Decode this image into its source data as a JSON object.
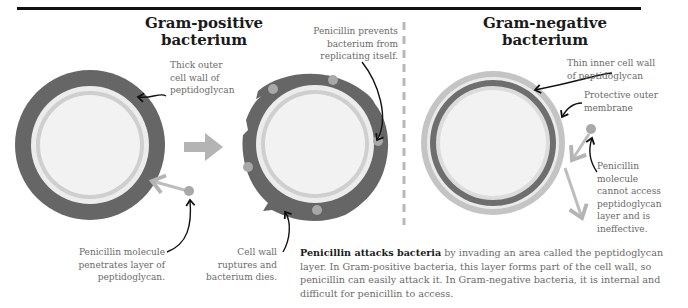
{
  "gram_positive": {
    "title_line1": "Gram-positive",
    "title_line2": "bacterium",
    "label_wall": [
      "Thick outer",
      "cell wall of",
      "peptidoglycan"
    ],
    "label_penetrates": [
      "Penicillin molecule",
      "penetrates layer of",
      "peptidoglycan."
    ],
    "label_prevents": [
      "Penicillin prevents",
      "bacterium from",
      "replicating itself."
    ],
    "label_ruptures": [
      "Cell wall",
      "ruptures and",
      "bacterium dies."
    ]
  },
  "gram_negative": {
    "title_line1": "Gram-negative",
    "title_line2": "bacterium",
    "label_inner_wall": [
      "Thin inner cell wall",
      "of peptidoglycan"
    ],
    "label_outer_membrane": [
      "Protective outer",
      "membrane"
    ],
    "label_ineffective": [
      "Penicillin",
      "molecule",
      "cannot access",
      "peptidoglycan",
      "layer and is",
      "ineffective."
    ]
  },
  "summary": {
    "bold": "Penicillin attacks bacteria",
    "text": " by invading an area called the peptidoglycan layer. In Gram-positive bacteria, this layer forms part of the cell wall, so penicillin can easily attack it. In Gram-negative bacteria, it is internal and difficult for penicillin to access."
  },
  "colors": {
    "thick_wall": "#666666",
    "inner_ring": "#c8c8c8",
    "cell_fill": "#f2f2f2",
    "molecule": "#a8a8a8",
    "arrow": "#b4b4b4",
    "divider": "#b8b8b8"
  }
}
